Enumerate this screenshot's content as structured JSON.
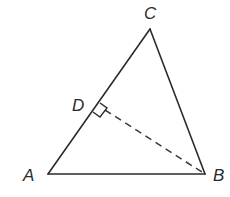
{
  "diagram": {
    "type": "triangle-with-altitude",
    "points": {
      "A": {
        "label": "A",
        "x": 48,
        "y": 174
      },
      "B": {
        "label": "B",
        "x": 205,
        "y": 174
      },
      "C": {
        "label": "C",
        "x": 150,
        "y": 29
      },
      "D": {
        "label": "D",
        "x": 98,
        "y": 105
      }
    },
    "segments": [
      {
        "from": "A",
        "to": "B",
        "style": "solid"
      },
      {
        "from": "B",
        "to": "C",
        "style": "solid"
      },
      {
        "from": "C",
        "to": "A",
        "style": "solid"
      },
      {
        "from": "D",
        "to": "B",
        "style": "dashed"
      }
    ],
    "annotations": {
      "right_angle_at": "D",
      "note": "BD perpendicular to AC"
    },
    "colors": {
      "stroke": "#2b2b2b",
      "background": "#ffffff"
    }
  }
}
